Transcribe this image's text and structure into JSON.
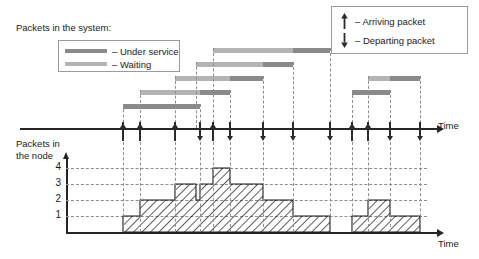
{
  "title": "Packets in the system:",
  "legend_left": {
    "items": [
      {
        "label": "– Under service",
        "color": "#8a8a8a",
        "name": "under-service"
      },
      {
        "label": "– Waiting",
        "color": "#b4b4b4",
        "name": "waiting"
      }
    ]
  },
  "legend_right": {
    "items": [
      {
        "label": "– Arriving packet",
        "glyph": "arrow-up",
        "name": "arriving-packet"
      },
      {
        "label": "– Departing packet",
        "glyph": "arrow-down",
        "name": "departing-packet"
      }
    ]
  },
  "upper_axis": {
    "label": "Time"
  },
  "lower_axis": {
    "label": "Time",
    "ylabel_line1": "Packets in",
    "ylabel_line2": "the node",
    "yticks": [
      "1",
      "2",
      "3",
      "4"
    ]
  },
  "colors": {
    "under_service": "#8a8a8a",
    "waiting": "#b4b4b4",
    "axis": "#262626",
    "dash": "#8d8d8d",
    "hatch": "#1a1a1a"
  },
  "chart_data": {
    "type": "table",
    "xlabel": "Time",
    "ylabel": "Packets in the node",
    "ylim": [
      0,
      4.6
    ],
    "yticks": [
      1,
      2,
      3,
      4
    ],
    "grid": true,
    "packets": [
      {
        "id": 1,
        "wait_start": 123,
        "service_start": 123,
        "end": 200
      },
      {
        "id": 2,
        "wait_start": 140,
        "service_start": 200,
        "end": 230
      },
      {
        "id": 3,
        "wait_start": 175,
        "service_start": 230,
        "end": 263
      },
      {
        "id": 4,
        "wait_start": 196,
        "service_start": 263,
        "end": 293
      },
      {
        "id": 5,
        "wait_start": 213,
        "service_start": 293,
        "end": 330
      },
      {
        "id": 6,
        "wait_start": 352,
        "service_start": 352,
        "end": 390
      },
      {
        "id": 7,
        "wait_start": 368,
        "service_start": 390,
        "end": 420
      }
    ],
    "arrivals": [
      123,
      140,
      175,
      196,
      213,
      352,
      368
    ],
    "departures": [
      200,
      230,
      263,
      293,
      330,
      390,
      420
    ],
    "events": [
      {
        "x": 123,
        "type": "arrival"
      },
      {
        "x": 140,
        "type": "arrival"
      },
      {
        "x": 175,
        "type": "arrival"
      },
      {
        "x": 200,
        "type": "departure"
      },
      {
        "x": 213,
        "type": "arrival"
      },
      {
        "x": 230,
        "type": "departure"
      },
      {
        "x": 263,
        "type": "departure"
      },
      {
        "x": 293,
        "type": "departure"
      },
      {
        "x": 330,
        "type": "departure"
      },
      {
        "x": 352,
        "type": "arrival"
      },
      {
        "x": 368,
        "type": "arrival"
      },
      {
        "x": 390,
        "type": "departure"
      },
      {
        "x": 420,
        "type": "departure"
      }
    ],
    "step_levels": [
      {
        "x_start": 123,
        "x_end": 140,
        "level": 1
      },
      {
        "x_start": 140,
        "x_end": 175,
        "level": 2
      },
      {
        "x_start": 175,
        "x_end": 196,
        "level": 3
      },
      {
        "x_start": 196,
        "x_end": 200,
        "level": 2
      },
      {
        "x_start": 200,
        "x_end": 213,
        "level": 3
      },
      {
        "x_start": 213,
        "x_end": 230,
        "level": 4
      },
      {
        "x_start": 230,
        "x_end": 263,
        "level": 3
      },
      {
        "x_start": 263,
        "x_end": 293,
        "level": 2
      },
      {
        "x_start": 293,
        "x_end": 330,
        "level": 1
      },
      {
        "x_start": 330,
        "x_end": 352,
        "level": 0
      },
      {
        "x_start": 352,
        "x_end": 368,
        "level": 1
      },
      {
        "x_start": 368,
        "x_end": 390,
        "level": 2
      },
      {
        "x_start": 390,
        "x_end": 420,
        "level": 1
      }
    ]
  }
}
